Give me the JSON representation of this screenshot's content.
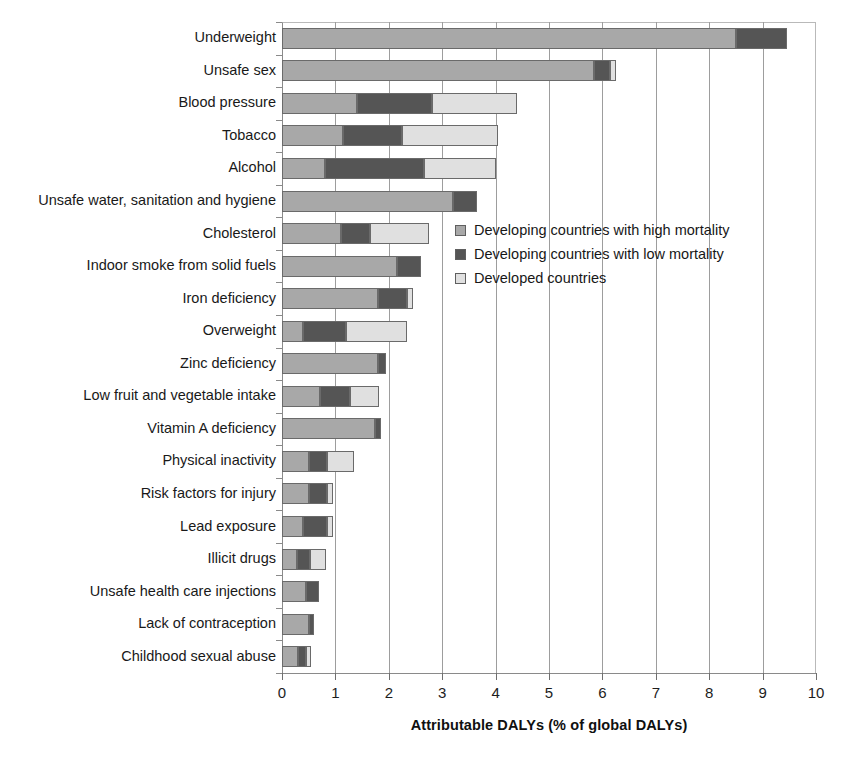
{
  "chart_data": {
    "type": "bar",
    "orientation": "horizontal",
    "stacked": true,
    "title": "",
    "xlabel": "Attributable DALYs (% of global DALYs)",
    "ylabel": "",
    "xlim": [
      0,
      10
    ],
    "xticks": [
      "0",
      "1",
      "2",
      "3",
      "4",
      "5",
      "6",
      "7",
      "8",
      "9",
      "10"
    ],
    "grid": "vertical",
    "legend_position": "inside-right-upper",
    "categories": [
      "Underweight",
      "Unsafe sex",
      "Blood pressure",
      "Tobacco",
      "Alcohol",
      "Unsafe water, sanitation and hygiene",
      "Cholesterol",
      "Indoor smoke from solid fuels",
      "Iron deficiency",
      "Overweight",
      "Zinc deficiency",
      "Low fruit and vegetable intake",
      "Vitamin A deficiency",
      "Physical inactivity",
      "Risk factors for injury",
      "Lead exposure",
      "Illicit drugs",
      "Unsafe health care injections",
      "Lack of contraception",
      "Childhood sexual abuse"
    ],
    "series": [
      {
        "name": "Developing countries with high mortality",
        "color": "#a8a8a8",
        "values": [
          8.5,
          5.85,
          1.4,
          1.15,
          0.8,
          3.2,
          1.1,
          2.15,
          1.8,
          0.4,
          1.8,
          0.72,
          1.75,
          0.5,
          0.5,
          0.4,
          0.28,
          0.45,
          0.5,
          0.3
        ]
      },
      {
        "name": "Developing countries with low mortality",
        "color": "#555555",
        "values": [
          0.95,
          0.3,
          1.4,
          1.1,
          1.85,
          0.45,
          0.55,
          0.45,
          0.55,
          0.8,
          0.15,
          0.55,
          0.1,
          0.35,
          0.35,
          0.45,
          0.25,
          0.25,
          0.1,
          0.15
        ]
      },
      {
        "name": "Developed  countries",
        "color": "#e0e0e0",
        "values": [
          0.0,
          0.1,
          1.6,
          1.8,
          1.35,
          0.0,
          1.1,
          0.0,
          0.1,
          1.15,
          0.0,
          0.55,
          0.0,
          0.5,
          0.1,
          0.1,
          0.3,
          0.0,
          0.0,
          0.1
        ]
      }
    ],
    "totals": [
      9.45,
      6.25,
      4.4,
      4.05,
      4.0,
      3.65,
      2.75,
      2.6,
      2.45,
      2.35,
      1.95,
      1.82,
      1.85,
      1.35,
      0.95,
      0.95,
      0.83,
      0.7,
      0.6,
      0.55
    ]
  },
  "legend": {
    "items": [
      {
        "label": "Developing countries with high mortality",
        "swatch": "s0"
      },
      {
        "label": "Developing countries with low mortality",
        "swatch": "s1"
      },
      {
        "label": "Developed  countries",
        "swatch": "s2"
      }
    ]
  }
}
